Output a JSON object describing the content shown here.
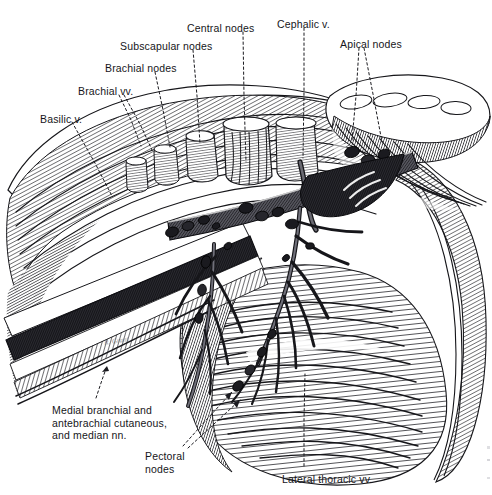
{
  "plate": {
    "title": "Axilla — lymph nodes and veins (anterior dissection)",
    "background_color": "#ffffff",
    "ink_color": "#16161a",
    "artist_signature": "R. Grant"
  },
  "labels": [
    {
      "id": "basilic-vein",
      "text": "Basilic v.",
      "x": 40,
      "y": 113,
      "align": "left"
    },
    {
      "id": "brachial-veins",
      "text": "Brachial vv.",
      "x": 78,
      "y": 85,
      "align": "left"
    },
    {
      "id": "brachial-nodes",
      "text": "Brachial nodes",
      "x": 105,
      "y": 62,
      "align": "left"
    },
    {
      "id": "subscapular-nodes",
      "text": "Subscapular nodes",
      "x": 120,
      "y": 40,
      "align": "left"
    },
    {
      "id": "central-nodes",
      "text": "Central nodes",
      "x": 187,
      "y": 22,
      "align": "left"
    },
    {
      "id": "cephalic-vein",
      "text": "Cephalic v.",
      "x": 277,
      "y": 18,
      "align": "left"
    },
    {
      "id": "apical-nodes",
      "text": "Apical nodes",
      "x": 340,
      "y": 38,
      "align": "left"
    },
    {
      "id": "medial-cutaneous-nerves",
      "text": "Medial branchial and\nantebrachial cutaneous,\nand median nn.",
      "x": 52,
      "y": 404,
      "align": "left"
    },
    {
      "id": "pectoral-nodes",
      "text": "Pectoral\nnodes",
      "x": 145,
      "y": 450,
      "align": "left"
    },
    {
      "id": "lateral-thoracic-veins",
      "text": "Lateral thoracic vv.",
      "x": 282,
      "y": 473,
      "align": "left"
    }
  ],
  "leaders": [
    {
      "id": "leader-basilic-vein",
      "points": "72,122 96,165 112,196"
    },
    {
      "id": "leader-brachial-veins",
      "points": "119,95 131,120 141,146"
    },
    {
      "id": "leader-brachial-veins-2",
      "points": "124,95 140,124 152,150"
    },
    {
      "id": "leader-brachial-nodes",
      "points": "155,72 163,110 170,147"
    },
    {
      "id": "leader-subscapular-nodes",
      "points": "193,50 197,96 200,144"
    },
    {
      "id": "leader-central-nodes",
      "points": "243,32 244,96 246,162"
    },
    {
      "id": "leader-cephalic-vein",
      "points": "304,28 304,92 303,158"
    },
    {
      "id": "leader-apical-nodes",
      "points": "359,48 356,96 352,140"
    },
    {
      "id": "leader-apical-nodes-2",
      "points": "364,48 373,94 382,142"
    },
    {
      "id": "leader-medial-cutaneous",
      "points": "96,398 102,380 107,366"
    },
    {
      "id": "leader-pectoral-nodes",
      "points": "183,446 208,418 232,392"
    },
    {
      "id": "leader-pectoral-nodes-2",
      "points": "188,448 214,424 240,400"
    },
    {
      "id": "leader-lateral-thoracic",
      "points": "304,466 304,420 305,374"
    }
  ],
  "structures": {
    "cut_muscle_stumps": [
      "deltoid",
      "pectoralis major",
      "pectoralis minor"
    ],
    "vessels": [
      "axillary vein",
      "cephalic vein",
      "basilic vein",
      "brachial veins",
      "lateral thoracic veins"
    ],
    "node_groups": [
      "apical",
      "central",
      "brachial",
      "subscapular",
      "pectoral"
    ]
  }
}
